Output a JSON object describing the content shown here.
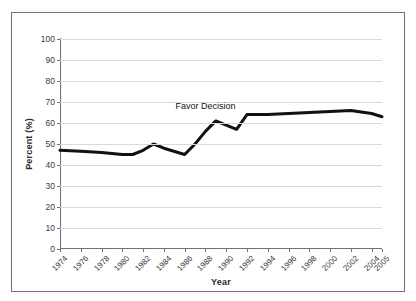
{
  "figure": {
    "top_clipped_caption": "",
    "border_color": "#6f7176",
    "background": "#ffffff"
  },
  "chart_data": {
    "type": "line",
    "title": "",
    "xlabel": "Year",
    "ylabel": "Percent (%)",
    "ylim": [
      0,
      100
    ],
    "ytick_labels": [
      "0",
      "10",
      "20",
      "30",
      "40",
      "50",
      "60",
      "70",
      "80",
      "90",
      "100"
    ],
    "ytick_values": [
      0,
      10,
      20,
      30,
      40,
      50,
      60,
      70,
      80,
      90,
      100
    ],
    "xtick_labels": [
      "1974",
      "1976",
      "1978",
      "1980",
      "1982",
      "1984",
      "1986",
      "1988",
      "1990",
      "1992",
      "1994",
      "1996",
      "1998",
      "2000",
      "2002",
      "2004",
      "2005"
    ],
    "xtick_values": [
      1974,
      1976,
      1978,
      1980,
      1982,
      1984,
      1986,
      1988,
      1990,
      1992,
      1994,
      1996,
      1998,
      2000,
      2002,
      2004,
      2005
    ],
    "xlim": [
      1974,
      2005
    ],
    "grid": "horizontal",
    "legend": "none",
    "series": [
      {
        "name": "Favor Decision",
        "color": "#111114",
        "line_width": 3,
        "x": [
          1974,
          1976,
          1978,
          1980,
          1981,
          1982,
          1983,
          1984,
          1986,
          1987,
          1988,
          1989,
          1990,
          1991,
          1992,
          1994,
          1996,
          1998,
          2000,
          2002,
          2004,
          2005
        ],
        "values": [
          47,
          46.5,
          46,
          45,
          45,
          47,
          50,
          48,
          45,
          50,
          56,
          61,
          59,
          57,
          64,
          64,
          64.5,
          65,
          65.5,
          66,
          64.5,
          63
        ]
      }
    ],
    "annotations": [
      {
        "text": "Favor Decision",
        "x": 1988,
        "y": 68,
        "color": "#111114"
      }
    ]
  }
}
